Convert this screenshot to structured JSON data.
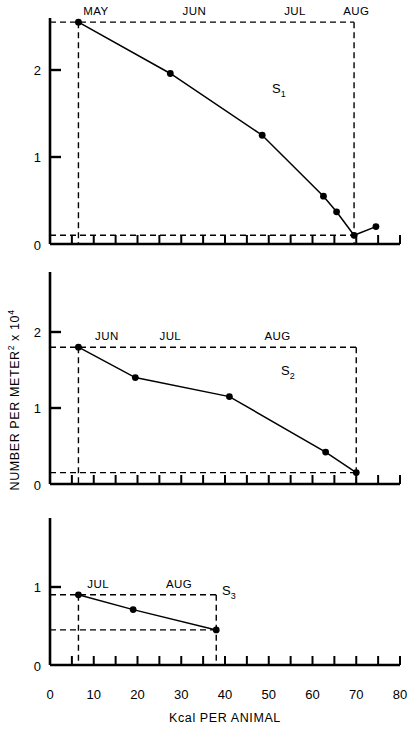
{
  "figure": {
    "xlabel": "Kcal PER ANIMAL",
    "ylabel_main": "NUMBER PER METER",
    "ylabel_sup": "2",
    "ylabel_tail": " x 10",
    "ylabel_exp": "4",
    "x_ticks": [
      0,
      10,
      20,
      30,
      40,
      50,
      60,
      70,
      80
    ],
    "x_tick_labels": [
      "0",
      "10",
      "20",
      "30",
      "40",
      "50",
      "60",
      "70",
      "80"
    ],
    "xlim": [
      0,
      80
    ],
    "minor_tick_step": 5
  },
  "chart_data": [
    {
      "type": "line",
      "name": "S1",
      "label": "S₁",
      "label_base": "S",
      "label_sub": "1",
      "title": "",
      "xlabel": "Kcal PER ANIMAL",
      "ylabel": "NUMBER PER METER2 x 104",
      "xlim": [
        0,
        80
      ],
      "ylim": [
        0,
        2.6
      ],
      "y_ticks": [
        1,
        2
      ],
      "y_tick_labels": [
        "1",
        "2"
      ],
      "y_zero_label": "0",
      "grid": false,
      "x": [
        6.5,
        27.5,
        48.5,
        62.5,
        65.5,
        69.5,
        74.5
      ],
      "y": [
        2.55,
        1.96,
        1.25,
        0.55,
        0.37,
        0.1,
        0.2
      ],
      "month_labels": [
        {
          "text": "MAY",
          "x": 10.5
        },
        {
          "text": "JUN",
          "x": 33.0
        },
        {
          "text": "JUL",
          "x": 56.0
        },
        {
          "text": "AUG",
          "x": 70.0
        }
      ],
      "guide_box": {
        "x_left": 6.5,
        "x_right": 69.5,
        "y_top": 2.55,
        "y_bottom": 0.1
      }
    },
    {
      "type": "line",
      "name": "S2",
      "label": "S₂",
      "label_base": "S",
      "label_sub": "2",
      "xlim": [
        0,
        80
      ],
      "ylim": [
        0,
        2.6
      ],
      "y_ticks": [
        1,
        2
      ],
      "y_tick_labels": [
        "1",
        "2"
      ],
      "y_zero_label": "0",
      "grid": false,
      "x": [
        6.5,
        19.5,
        41.0,
        63.0,
        70.0
      ],
      "y": [
        1.8,
        1.4,
        1.15,
        0.42,
        0.15
      ],
      "month_labels": [
        {
          "text": "JUN",
          "x": 13.0
        },
        {
          "text": "JUL",
          "x": 27.5
        },
        {
          "text": "AUG",
          "x": 52.0
        }
      ],
      "guide_box": {
        "x_left": 6.5,
        "x_right": 70.0,
        "y_top": 1.8,
        "y_bottom": 0.15
      }
    },
    {
      "type": "line",
      "name": "S3",
      "label": "S₃",
      "label_base": "S",
      "label_sub": "3",
      "xlim": [
        0,
        80
      ],
      "ylim": [
        0,
        1.9
      ],
      "y_ticks": [
        1
      ],
      "y_tick_labels": [
        "1"
      ],
      "y_zero_label": "0",
      "grid": false,
      "x": [
        6.5,
        19.0,
        38.0
      ],
      "y": [
        0.9,
        0.71,
        0.45
      ],
      "month_labels": [
        {
          "text": "JUL",
          "x": 11.0
        },
        {
          "text": "AUG",
          "x": 29.5
        }
      ],
      "guide_box": {
        "x_left": 6.5,
        "x_right": 38.0,
        "y_top": 0.9,
        "y_bottom": 0.45
      }
    }
  ]
}
